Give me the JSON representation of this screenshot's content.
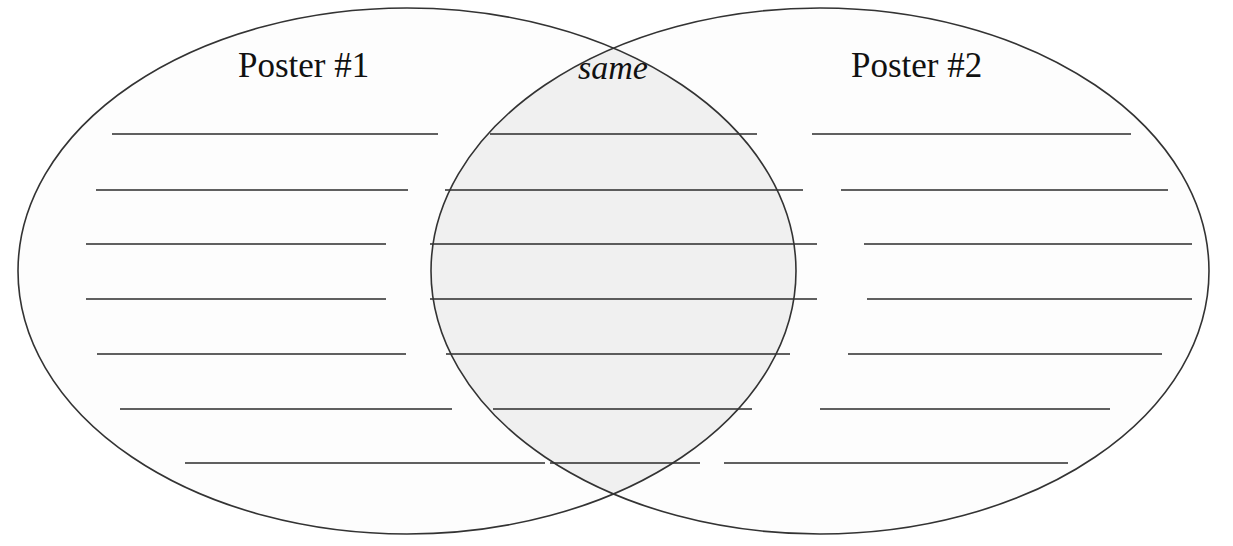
{
  "document": {
    "type": "venn-diagram-worksheet",
    "title": "Poster Comparison Venn Diagram",
    "background_color": "#ffffff"
  },
  "diagram": {
    "stroke_color": "#333333",
    "stroke_width": 1.6,
    "circle_fill": "#fdfdfd",
    "overlap_fill": "#f0f0f0",
    "line_color": "#2b2b2b",
    "left_circle": {
      "cx": 407,
      "cy": 271,
      "rx": 389,
      "ry": 263
    },
    "right_circle": {
      "cx": 820,
      "cy": 271,
      "rx": 389,
      "ry": 263
    }
  },
  "labels": {
    "left": {
      "text": "Poster #1",
      "x": 238,
      "y": 48,
      "style": "normal"
    },
    "center": {
      "text": "same",
      "x": 578,
      "y": 51,
      "style": "italic"
    },
    "right": {
      "text": "Poster #2",
      "x": 851,
      "y": 48,
      "style": "normal"
    }
  },
  "writing_lines": {
    "rows": 7,
    "columns": [
      "left",
      "middle",
      "right"
    ],
    "left": [
      {
        "y": 134,
        "x1": 112,
        "x2": 438
      },
      {
        "y": 190,
        "x1": 96,
        "x2": 408
      },
      {
        "y": 244,
        "x1": 86,
        "x2": 386
      },
      {
        "y": 299,
        "x1": 86,
        "x2": 386
      },
      {
        "y": 354,
        "x1": 97,
        "x2": 406
      },
      {
        "y": 409,
        "x1": 120,
        "x2": 452
      },
      {
        "y": 463,
        "x1": 185,
        "x2": 545
      }
    ],
    "middle": [
      {
        "y": 134,
        "x1": 490,
        "x2": 757
      },
      {
        "y": 190,
        "x1": 445,
        "x2": 803
      },
      {
        "y": 244,
        "x1": 430,
        "x2": 817
      },
      {
        "y": 299,
        "x1": 430,
        "x2": 817
      },
      {
        "y": 354,
        "x1": 446,
        "x2": 790
      },
      {
        "y": 409,
        "x1": 493,
        "x2": 752
      },
      {
        "y": 463,
        "x1": 550,
        "x2": 700
      }
    ],
    "right": [
      {
        "y": 134,
        "x1": 812,
        "x2": 1131
      },
      {
        "y": 190,
        "x1": 841,
        "x2": 1168
      },
      {
        "y": 244,
        "x1": 864,
        "x2": 1192
      },
      {
        "y": 299,
        "x1": 867,
        "x2": 1192
      },
      {
        "y": 354,
        "x1": 848,
        "x2": 1162
      },
      {
        "y": 409,
        "x1": 820,
        "x2": 1110
      },
      {
        "y": 463,
        "x1": 724,
        "x2": 1068
      }
    ]
  }
}
